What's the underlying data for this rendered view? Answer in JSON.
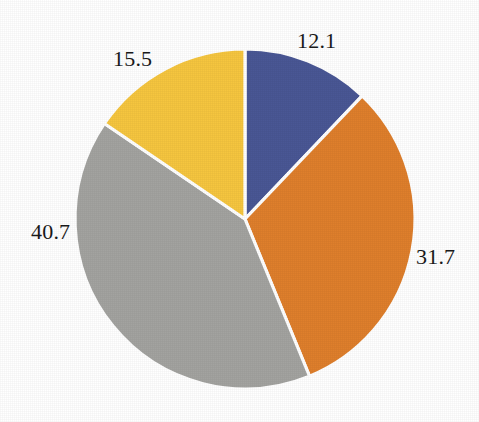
{
  "chart_data": {
    "type": "pie",
    "title": "",
    "subtitle": "",
    "xlabel": "",
    "ylabel": "",
    "grid": false,
    "legend": "none",
    "background_color": "#ffffff",
    "label_color": "#1a1a1a",
    "start_angle_deg": 0,
    "direction": "clockwise",
    "total": 100.0,
    "categories": [
      "Slice 1",
      "Slice 2",
      "Slice 3",
      "Slice 4"
    ],
    "values": [
      12.1,
      31.7,
      40.7,
      15.5
    ],
    "colors": [
      "#4a5795",
      "#df7f2c",
      "#a3a3a0",
      "#f6c63f"
    ],
    "slices": [
      {
        "label": "12.1",
        "value": 12.1,
        "color": "#4a5795",
        "color_name": "navy-blue",
        "start_deg": 0.0,
        "end_deg": 43.56,
        "label_position": "top-right-outside"
      },
      {
        "label": "31.7",
        "value": 31.7,
        "color": "#df7f2c",
        "color_name": "orange",
        "start_deg": 43.56,
        "end_deg": 157.68,
        "label_position": "right-outside"
      },
      {
        "label": "40.7",
        "value": 40.7,
        "color": "#a3a3a0",
        "color_name": "gray",
        "start_deg": 157.68,
        "end_deg": 304.2,
        "label_position": "left-outside"
      },
      {
        "label": "15.5",
        "value": 15.5,
        "color": "#f6c63f",
        "color_name": "yellow",
        "start_deg": 304.2,
        "end_deg": 360.0,
        "label_position": "top-left-outside"
      }
    ],
    "geometry": {
      "center_x": 245,
      "center_y": 219,
      "radius": 170,
      "separator_color": "#ffffff",
      "separator_width": 3.2
    }
  }
}
